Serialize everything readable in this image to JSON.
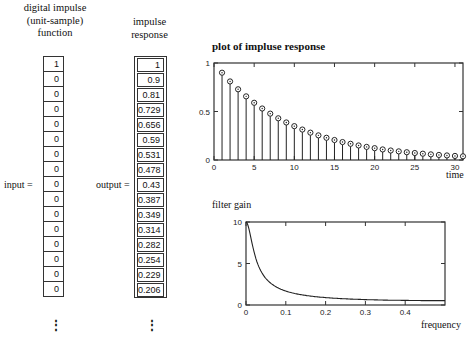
{
  "input_column": {
    "header": [
      "digital impulse",
      "(unit-sample)",
      "function"
    ],
    "label": "input =",
    "values": [
      "1",
      "0",
      "0",
      "0",
      "0",
      "0",
      "0",
      "0",
      "0",
      "0",
      "0",
      "0",
      "0",
      "0",
      "0",
      "0"
    ],
    "continuation": "⋮"
  },
  "output_column": {
    "header": [
      "impulse",
      "response"
    ],
    "label": "output =",
    "values": [
      "1",
      "0.9",
      "0.81",
      "0.729",
      "0.656",
      "0.59",
      "0.531",
      "0.478",
      "0.43",
      "0.387",
      "0.349",
      "0.314",
      "0.282",
      "0.254",
      "0.229",
      "0.206"
    ],
    "continuation": "⋮"
  },
  "chart_data": [
    {
      "type": "stem",
      "title": "plot of impluse response",
      "xlabel": "time",
      "ylabel": "",
      "xlim": [
        0,
        31
      ],
      "ylim": [
        0,
        1
      ],
      "xticks": [
        "0",
        "5",
        "10",
        "15",
        "20",
        "25",
        "30"
      ],
      "yticks": [
        "0",
        "0.5",
        "1"
      ],
      "x": [
        1,
        2,
        3,
        4,
        5,
        6,
        7,
        8,
        9,
        10,
        11,
        12,
        13,
        14,
        15,
        16,
        17,
        18,
        19,
        20,
        21,
        22,
        23,
        24,
        25,
        26,
        27,
        28,
        29,
        30,
        31
      ],
      "values": [
        0.9,
        0.81,
        0.729,
        0.656,
        0.59,
        0.531,
        0.478,
        0.43,
        0.387,
        0.349,
        0.314,
        0.282,
        0.254,
        0.229,
        0.206,
        0.185,
        0.167,
        0.15,
        0.135,
        0.122,
        0.109,
        0.098,
        0.089,
        0.08,
        0.072,
        0.065,
        0.058,
        0.052,
        0.047,
        0.042,
        0.038
      ]
    },
    {
      "type": "line",
      "title": "filter gain",
      "xlabel": "frequency",
      "ylabel": "",
      "xlim": [
        0,
        0.5
      ],
      "ylim": [
        0,
        10
      ],
      "xticks": [
        "0",
        "0.1",
        "0.2",
        "0.3",
        "0.4"
      ],
      "yticks": [
        "0",
        "5",
        "10"
      ],
      "x": [
        0,
        0.01,
        0.02,
        0.03,
        0.04,
        0.05,
        0.06,
        0.08,
        0.1,
        0.15,
        0.2,
        0.25,
        0.3,
        0.35,
        0.4,
        0.45,
        0.5
      ],
      "values": [
        10,
        8.47,
        6.22,
        4.66,
        3.68,
        3.04,
        2.59,
        2.02,
        1.68,
        1.23,
        1.01,
        0.86,
        0.73,
        0.65,
        0.6,
        0.57,
        0.53
      ]
    }
  ]
}
